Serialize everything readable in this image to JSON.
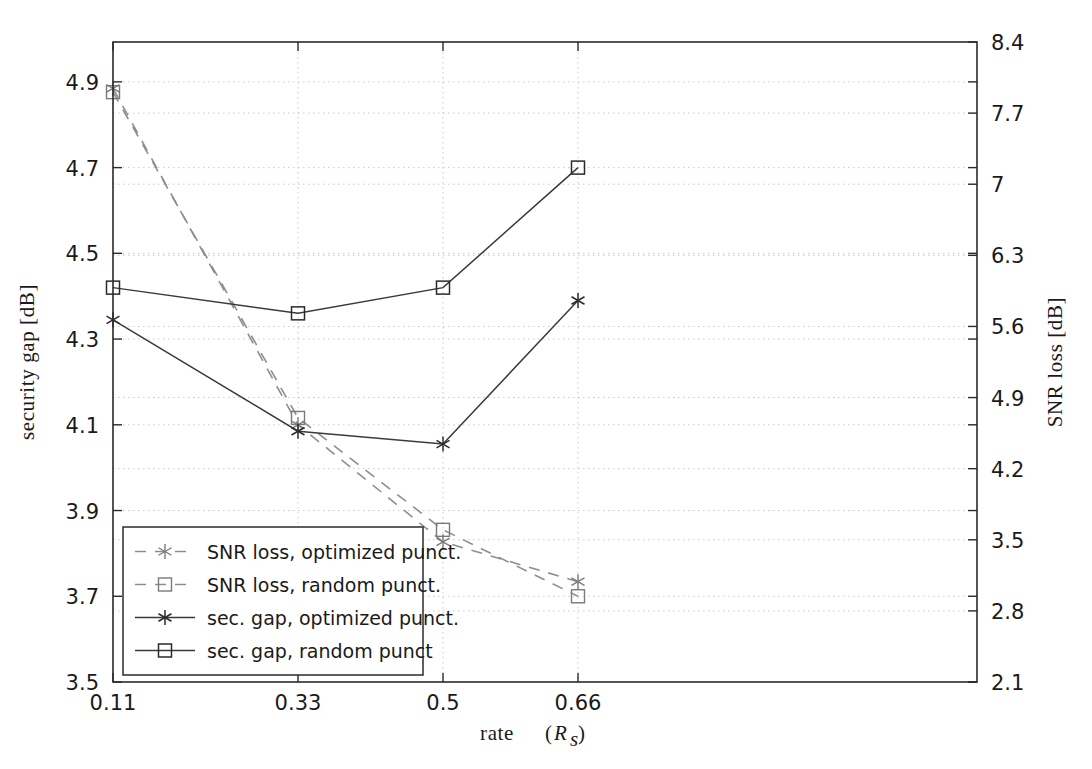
{
  "chart_data": {
    "type": "line",
    "title": "",
    "xlabel": "rate (R_s)",
    "ylabel": "security gap [dB]",
    "y2label": "SNR loss [dB]",
    "x": [
      0.11,
      0.33,
      0.5,
      0.66
    ],
    "xticklabels": [
      "0.11",
      "0.33",
      "0.5",
      "0.66"
    ],
    "ylim": [
      3.5,
      4.993
    ],
    "yticks": [
      3.5,
      3.7,
      3.9,
      4.1,
      4.3,
      4.5,
      4.7,
      4.9
    ],
    "yticklabels": [
      "3.5",
      "3.7",
      "3.9",
      "4.1",
      "4.3",
      "4.5",
      "4.7",
      "4.9"
    ],
    "y2lim": [
      2.1,
      8.4
    ],
    "y2ticks": [
      2.1,
      2.8,
      3.5,
      4.2,
      4.9,
      5.6,
      6.3,
      7.0,
      7.7,
      8.4
    ],
    "y2ticklabels": [
      "2.1",
      "2.8",
      "3.5",
      "4.2",
      "4.9",
      "5.6",
      "6.3",
      "7",
      "7.7",
      "8.4"
    ],
    "grid": true,
    "legend_position": "lower-left",
    "series": [
      {
        "name": "SNR loss, optimized punct.",
        "axis": "right",
        "linestyle": "dashed",
        "marker": "asterisk",
        "color": "#8e8e8e",
        "values_right_axis": [
          7.79,
          4.55,
          3.32,
          2.9
        ],
        "values_left_axis": [
          4.885,
          4.1,
          3.827,
          3.734
        ]
      },
      {
        "name": "SNR loss, random punct.",
        "axis": "right",
        "linestyle": "dashed",
        "marker": "square",
        "color": "#8e8e8e",
        "values_right_axis": [
          7.75,
          4.62,
          3.43,
          2.73
        ],
        "values_left_axis": [
          4.876,
          4.116,
          3.855,
          3.7
        ]
      },
      {
        "name": "sec. gap, optimized punct.",
        "axis": "left",
        "linestyle": "solid",
        "marker": "asterisk",
        "color": "#3a3a3a",
        "values_left_axis": [
          4.345,
          4.085,
          4.055,
          4.39
        ]
      },
      {
        "name": "sec. gap, random punct",
        "axis": "left",
        "linestyle": "solid",
        "marker": "square",
        "color": "#3a3a3a",
        "values_left_axis": [
          4.42,
          4.36,
          4.42,
          4.7
        ]
      }
    ],
    "legend_entries": [
      {
        "label": "SNR loss, optimized punct.",
        "linestyle": "dashed",
        "marker": "asterisk"
      },
      {
        "label": "SNR loss, random punct.",
        "linestyle": "dashed",
        "marker": "square"
      },
      {
        "label": "sec. gap, optimized punct.",
        "linestyle": "solid",
        "marker": "asterisk"
      },
      {
        "label": "sec. gap, random punct",
        "linestyle": "solid",
        "marker": "square"
      }
    ]
  },
  "axis_titles": {
    "left": "security gap [dB]",
    "right": "SNR loss [dB]",
    "bottom_main": "rate",
    "bottom_paren_open": "(",
    "bottom_var": "R",
    "bottom_sub": "s",
    "bottom_paren_close": ")"
  }
}
